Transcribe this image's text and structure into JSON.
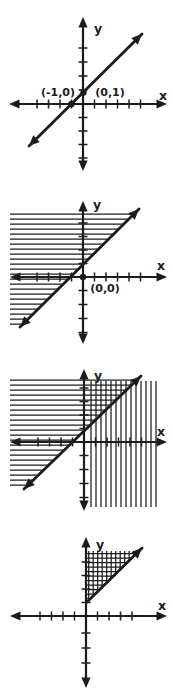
{
  "palette": {
    "background": "#ffffff",
    "ink": "#1c1c1c"
  },
  "figure": {
    "width": 175,
    "height": 692,
    "graphs": [
      {
        "name": "graph-step1-line-through-points",
        "x_axis": {
          "label": "x",
          "y": 104,
          "x1": 9,
          "x2": 167,
          "label_x": 163,
          "label_y": 100,
          "ticks": [
            37,
            48.5,
            60,
            71.5,
            94.5,
            106,
            117.5,
            129,
            140.5
          ]
        },
        "y_axis": {
          "label": "y",
          "x": 83,
          "y1": 17,
          "y2": 171,
          "label_x": 98,
          "label_y": 33,
          "ticks": [
            48,
            62,
            76,
            90,
            117.5,
            131,
            144.5,
            158
          ]
        },
        "lines": [
          {
            "x1": 29,
            "y1": 146,
            "x2": 142,
            "y2": 34,
            "arrow_start": true,
            "arrow_end": true
          }
        ],
        "dots": [
          {
            "x": 71.5,
            "y": 104
          },
          {
            "x": 83.5,
            "y": 92.5
          }
        ],
        "point_labels": [
          {
            "text": "(-1,0)",
            "x": 58,
            "y": 96
          },
          {
            "text": "(0,1)",
            "x": 110,
            "y": 96
          }
        ],
        "hatches": []
      },
      {
        "name": "graph-step2-halfplane-above-line",
        "x_axis": {
          "label": "x",
          "y": 277,
          "x1": 10,
          "x2": 167,
          "label_x": 161,
          "label_y": 270,
          "ticks": [
            37,
            48.5,
            60,
            71.5,
            94.5,
            106,
            117.5,
            129,
            140.5
          ]
        },
        "y_axis": {
          "label": "y",
          "x": 83,
          "y1": 201,
          "y2": 344,
          "label_x": 97,
          "label_y": 209,
          "ticks": [
            263.5,
            250,
            236.5,
            223,
            290.5,
            304.5,
            318.5,
            332.5
          ]
        },
        "lines": [
          {
            "x1": 20,
            "y1": 327,
            "x2": 139,
            "y2": 209,
            "arrow_start": true,
            "arrow_end": true
          }
        ],
        "dots": [
          {
            "x": 83,
            "y": 277
          }
        ],
        "point_labels": [
          {
            "text": "(0,0)",
            "x": 105,
            "y": 292
          }
        ],
        "hatches": [
          {
            "dir": "h",
            "spacing": 5,
            "region": [
              [
                10,
                211
              ],
              [
                138,
                211
              ],
              [
                20,
                327
              ],
              [
                10,
                327
              ]
            ]
          }
        ]
      },
      {
        "name": "graph-step3-both-halfplanes",
        "x_axis": {
          "label": "x",
          "y": 442,
          "x1": 10,
          "x2": 167,
          "label_x": 161,
          "label_y": 436,
          "ticks": [
            38,
            49.5,
            61,
            72.5,
            95.5,
            107,
            118.5,
            130,
            141.5
          ]
        },
        "y_axis": {
          "label": "y",
          "x": 84,
          "y1": 369,
          "y2": 511,
          "label_x": 98,
          "label_y": 380,
          "ticks": [
            428.5,
            415,
            401.5,
            388,
            455.5,
            469.5,
            483.5,
            497.5
          ]
        },
        "lines": [
          {
            "x1": 24,
            "y1": 489,
            "x2": 141,
            "y2": 376,
            "arrow_start": true,
            "arrow_end": true
          }
        ],
        "dots": [],
        "point_labels": [],
        "hatches": [
          {
            "dir": "h",
            "spacing": 5,
            "region": [
              [
                10,
                377
              ],
              [
                140,
                377
              ],
              [
                24,
                489
              ],
              [
                10,
                489
              ]
            ]
          },
          {
            "dir": "v",
            "spacing": 5,
            "region": [
              [
                88,
                381
              ],
              [
                157,
                381
              ],
              [
                157,
                507
              ],
              [
                88,
                507
              ]
            ]
          }
        ]
      },
      {
        "name": "graph-step4-solution-region",
        "x_axis": {
          "label": "x",
          "y": 616,
          "x1": 10,
          "x2": 167,
          "label_x": 162,
          "label_y": 610,
          "ticks": [
            40,
            51.5,
            63,
            74.5,
            97.5,
            109,
            120.5,
            132
          ]
        },
        "y_axis": {
          "label": "y",
          "x": 86,
          "y1": 537,
          "y2": 688,
          "label_x": 100,
          "label_y": 549,
          "ticks": [
            602.5,
            589,
            575.5,
            562,
            633,
            648,
            663
          ]
        },
        "lines": [
          {
            "x1": 87,
            "y1": 602,
            "x2": 142,
            "y2": 548,
            "arrow_start": false,
            "arrow_end": true
          }
        ],
        "dots": [],
        "point_labels": [],
        "hatches": [
          {
            "dir": "h",
            "spacing": 4.5,
            "region": [
              [
                86,
                551
              ],
              [
                140,
                551
              ],
              [
                87,
                603
              ]
            ]
          },
          {
            "dir": "v",
            "spacing": 4.5,
            "region": [
              [
                86,
                551
              ],
              [
                140,
                551
              ],
              [
                87,
                603
              ]
            ]
          }
        ]
      }
    ]
  }
}
